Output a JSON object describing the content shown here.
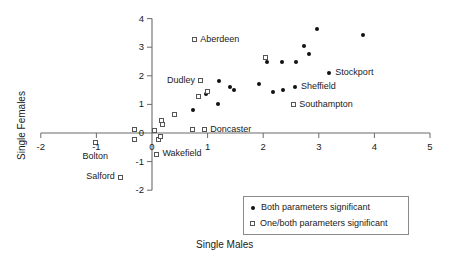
{
  "chart_data": {
    "type": "scatter",
    "title": "",
    "xlabel": "Single Males",
    "ylabel": "Single Females",
    "xlim": [
      -2,
      5
    ],
    "ylim": [
      -2,
      4
    ],
    "xticks": [
      -2,
      -1,
      0,
      1,
      2,
      3,
      4,
      5
    ],
    "xticklabels": [
      "-2",
      "-1",
      "0",
      "1",
      "2",
      "3",
      "4",
      "5"
    ],
    "yticks": [
      -2,
      -1,
      0,
      1,
      2,
      3,
      4
    ],
    "yticklabels": [
      "-2",
      "-1",
      "0",
      "1",
      "2",
      "3",
      "4"
    ],
    "grid": false,
    "legend_position": "lower right",
    "series": [
      {
        "name": "Both parameters significant",
        "marker": "filled-circle",
        "color": "#111111",
        "points": [
          {
            "x": 0.74,
            "y": 0.81,
            "label": ""
          },
          {
            "x": 0.98,
            "y": 1.35,
            "label": ""
          },
          {
            "x": 1.18,
            "y": 1.0,
            "label": ""
          },
          {
            "x": 1.2,
            "y": 1.81,
            "label": ""
          },
          {
            "x": 1.41,
            "y": 1.62,
            "label": ""
          },
          {
            "x": 1.48,
            "y": 1.49,
            "label": ""
          },
          {
            "x": 1.92,
            "y": 1.73,
            "label": ""
          },
          {
            "x": 2.06,
            "y": 2.49,
            "label": ""
          },
          {
            "x": 2.18,
            "y": 1.43,
            "label": ""
          },
          {
            "x": 2.34,
            "y": 2.49,
            "label": ""
          },
          {
            "x": 2.36,
            "y": 1.52,
            "label": ""
          },
          {
            "x": 2.57,
            "y": 1.62,
            "label": "Sheffield"
          },
          {
            "x": 2.59,
            "y": 2.47,
            "label": ""
          },
          {
            "x": 2.74,
            "y": 3.04,
            "label": ""
          },
          {
            "x": 2.82,
            "y": 2.75,
            "label": ""
          },
          {
            "x": 2.97,
            "y": 3.63,
            "label": ""
          },
          {
            "x": 3.19,
            "y": 2.1,
            "label": "Stockport"
          },
          {
            "x": 3.8,
            "y": 3.43,
            "label": ""
          }
        ]
      },
      {
        "name": "One/both parameters significant",
        "marker": "open-square",
        "color": "#555555",
        "points": [
          {
            "x": -1.02,
            "y": -0.33,
            "label": "Bolton"
          },
          {
            "x": -0.56,
            "y": -1.54,
            "label": "Salford"
          },
          {
            "x": -0.32,
            "y": 0.12,
            "label": ""
          },
          {
            "x": -0.31,
            "y": -0.22,
            "label": ""
          },
          {
            "x": 0.04,
            "y": 0.09,
            "label": ""
          },
          {
            "x": 0.08,
            "y": -0.75,
            "label": "Wakefield"
          },
          {
            "x": 0.12,
            "y": -0.24,
            "label": ""
          },
          {
            "x": 0.15,
            "y": -0.12,
            "label": ""
          },
          {
            "x": 0.17,
            "y": 0.44,
            "label": ""
          },
          {
            "x": 0.18,
            "y": 0.3,
            "label": ""
          },
          {
            "x": 0.4,
            "y": 0.64,
            "label": ""
          },
          {
            "x": 0.73,
            "y": 0.12,
            "label": ""
          },
          {
            "x": 0.76,
            "y": 3.26,
            "label": "Aberdeen"
          },
          {
            "x": 0.84,
            "y": 1.26,
            "label": ""
          },
          {
            "x": 0.88,
            "y": 1.83,
            "label": "Dudley"
          },
          {
            "x": 0.94,
            "y": 0.11,
            "label": "Doncaster"
          },
          {
            "x": 1.0,
            "y": 1.46,
            "label": ""
          },
          {
            "x": 2.04,
            "y": 2.65,
            "label": ""
          },
          {
            "x": 2.54,
            "y": 0.98,
            "label": "Southampton"
          }
        ]
      }
    ],
    "annotations": [
      {
        "text": "Aberdeen",
        "x": 0.76,
        "y": 3.26,
        "side": "right"
      },
      {
        "text": "Dudley",
        "x": 0.88,
        "y": 1.83,
        "side": "left"
      },
      {
        "text": "Doncaster",
        "x": 0.94,
        "y": 0.11,
        "side": "right"
      },
      {
        "text": "Southampton",
        "x": 2.54,
        "y": 0.98,
        "side": "right"
      },
      {
        "text": "Sheffield",
        "x": 2.57,
        "y": 1.62,
        "side": "right"
      },
      {
        "text": "Stockport",
        "x": 3.19,
        "y": 2.1,
        "side": "right"
      },
      {
        "text": "Bolton",
        "x": -1.02,
        "y": -0.33,
        "side": "below"
      },
      {
        "text": "Salford",
        "x": -0.56,
        "y": -1.54,
        "side": "left"
      },
      {
        "text": "Wakefield",
        "x": 0.08,
        "y": -0.75,
        "side": "right"
      }
    ],
    "legend": [
      {
        "marker": "filled-circle",
        "label": "Both parameters significant"
      },
      {
        "marker": "open-square",
        "label": "One/both parameters significant"
      }
    ]
  },
  "axes": {
    "x_title": "Single Males",
    "y_title": "Single Females",
    "x_tick_labels": [
      "-2",
      "-1",
      "0",
      "1",
      "2",
      "3",
      "4",
      "5"
    ],
    "y_tick_labels": [
      "4",
      "3",
      "2",
      "1",
      "0",
      "-1",
      "-2"
    ]
  },
  "labels": {
    "aberdeen": "Aberdeen",
    "dudley": "Dudley",
    "doncaster": "Doncaster",
    "southampton": "Southampton",
    "sheffield": "Sheffield",
    "stockport": "Stockport",
    "bolton": "Bolton",
    "salford": "Salford",
    "wakefield": "Wakefield"
  },
  "legend": {
    "entry_both": "Both parameters significant",
    "entry_onebooth": "One/both parameters significant"
  },
  "colors": {
    "axis": "#6b6b6b",
    "filled_marker": "#111111",
    "open_marker": "#555555",
    "text": "#1a1a1a",
    "legend_border": "#8a8a8a"
  }
}
